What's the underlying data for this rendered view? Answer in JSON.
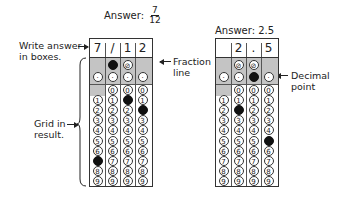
{
  "left_grid": {
    "title_prefix": "Answer:",
    "fraction_numerator": "7",
    "fraction_denominator": "12",
    "boxes": [
      "7",
      "/",
      "1",
      "2"
    ],
    "filled": [
      {
        "col": 0,
        "value": "7"
      },
      {
        "col": 1,
        "value": "/"
      },
      {
        "col": 2,
        "value": "1"
      },
      {
        "col": 3,
        "value": "2"
      }
    ]
  },
  "right_grid": {
    "title": "Answer: 2.5",
    "boxes": [
      "",
      "2",
      ".",
      "5"
    ],
    "filled": [
      {
        "col": 1,
        "value": "2"
      },
      {
        "col": 2,
        "value": "."
      },
      {
        "col": 3,
        "value": "5"
      }
    ]
  },
  "annotations": {
    "write_answer_line1": "Write answer",
    "write_answer_line2": "in boxes.",
    "fraction_line1": "Fraction",
    "fraction_line2": "line",
    "grid_in_line1": "Grid in",
    "grid_in_line2": "result.",
    "decimal_line1": "Decimal",
    "decimal_line2": "point"
  },
  "bubble_labels": {
    "slash": "⊘",
    "dot": "·",
    "digits": [
      "0",
      "1",
      "2",
      "3",
      "4",
      "5",
      "6",
      "7",
      "8",
      "9"
    ]
  },
  "colors": {
    "shade": "#c4c4c4",
    "filled_bubble": "#111111",
    "line": "#333333"
  }
}
